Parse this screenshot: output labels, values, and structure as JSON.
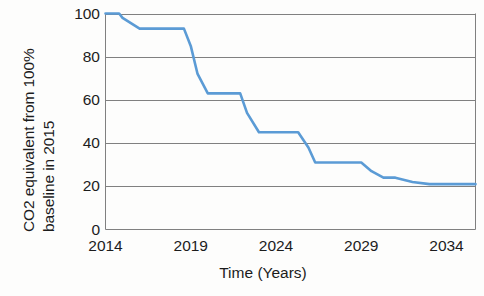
{
  "chart_data": {
    "type": "line",
    "title": "",
    "xlabel": "Time (Years)",
    "ylabel": "CO2 equivalent from 100% baseline in 2015",
    "ylabel_lines": [
      "CO2 equivalent from 100%",
      "baseline in 2015"
    ],
    "xlim": [
      2014,
      2035.7
    ],
    "ylim": [
      0,
      100
    ],
    "yticks": [
      0,
      20,
      40,
      60,
      80,
      100
    ],
    "ytick_labels": [
      "0",
      "20",
      "40",
      "60",
      "80",
      "100"
    ],
    "xticks": [
      2014,
      2019,
      2024,
      2029,
      2034
    ],
    "xtick_labels": [
      "2014",
      "2019",
      "2024",
      "2029",
      "2034"
    ],
    "grid": "horizontal",
    "legend": "none",
    "series": [
      {
        "name": "CO2 equivalent",
        "color": "#5B9BD5",
        "x": [
          2014.0,
          2014.8,
          2015.0,
          2016.0,
          2017.0,
          2018.0,
          2018.6,
          2019.0,
          2019.4,
          2020.0,
          2021.0,
          2021.3,
          2021.9,
          2022.3,
          2023.0,
          2024.0,
          2025.0,
          2025.3,
          2025.9,
          2026.3,
          2027.0,
          2028.0,
          2029.0,
          2029.6,
          2030.3,
          2031.0,
          2032.0,
          2033.0,
          2034.0,
          2035.0,
          2035.7
        ],
        "y": [
          100,
          100,
          98,
          93,
          93,
          93,
          93,
          85,
          72,
          63,
          63,
          63,
          63,
          54,
          45,
          45,
          45,
          45,
          38,
          31,
          31,
          31,
          31,
          27,
          24,
          24,
          22,
          21,
          21,
          21,
          21
        ],
        "steps": [
          {
            "from_year": 2014.0,
            "to_year": 2014.9,
            "value": 100
          },
          {
            "from_year": 2015.5,
            "to_year": 2018.6,
            "value": 93
          },
          {
            "from_year": 2019.6,
            "to_year": 2021.7,
            "value": 63
          },
          {
            "from_year": 2022.5,
            "to_year": 2025.4,
            "value": 45
          },
          {
            "from_year": 2026.3,
            "to_year": 2028.9,
            "value": 31
          },
          {
            "from_year": 2029.9,
            "to_year": 2031.3,
            "value": 24
          },
          {
            "from_year": 2032.3,
            "to_year": 2035.7,
            "value": 21
          }
        ]
      }
    ],
    "colors": {
      "line": "#5B9BD5",
      "grid": "#808080",
      "axis": "#808080",
      "text": "#1c1c1c",
      "background": "#fdfdfc"
    }
  }
}
